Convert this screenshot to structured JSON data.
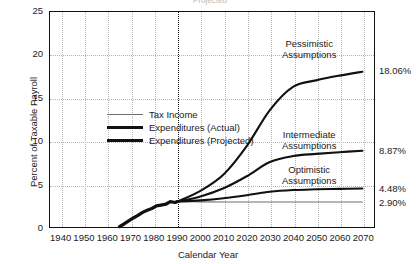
{
  "clipped_title": "Projected",
  "chart_data": {
    "type": "line",
    "title": "",
    "xlabel": "Calendar Year",
    "ylabel": "Percent of Taxable Payroll",
    "xlim": [
      1935,
      2075
    ],
    "ylim": [
      0,
      25
    ],
    "xticks": [
      1940,
      1950,
      1960,
      1970,
      1980,
      1990,
      2000,
      2010,
      2020,
      2030,
      2040,
      2050,
      2060,
      2070
    ],
    "yticks": [
      0,
      5,
      10,
      15,
      20,
      25
    ],
    "grid": true,
    "legend_position": "inside-upper-left",
    "vertical_marker": {
      "x": 1990,
      "style": "dotted",
      "label": ""
    },
    "series": [
      {
        "name": "Tax Income",
        "style": "thin",
        "color": "#6f6f6f",
        "x": [
          1990,
          2000,
          2010,
          2020,
          2030,
          2040,
          2050,
          2060,
          2070
        ],
        "values": [
          2.95,
          2.92,
          2.9,
          2.9,
          2.9,
          2.9,
          2.9,
          2.9,
          2.9
        ],
        "end_label": "2.90%"
      },
      {
        "name": "Expenditures (Actual)",
        "style": "thick",
        "color": "#111111",
        "x": [
          1965,
          1967,
          1969,
          1971,
          1973,
          1975,
          1977,
          1979,
          1981,
          1983,
          1985,
          1987,
          1989,
          1990
        ],
        "values": [
          0.05,
          0.35,
          0.7,
          1.05,
          1.35,
          1.7,
          1.95,
          2.15,
          2.45,
          2.55,
          2.65,
          2.95,
          2.85,
          2.95
        ]
      },
      {
        "name": "Expenditures (Projected)",
        "style": "medium",
        "color": "#111111",
        "scenario": "Pessimistic Assumptions",
        "x": [
          1990,
          2000,
          2010,
          2020,
          2030,
          2040,
          2050,
          2060,
          2070
        ],
        "values": [
          2.95,
          4.2,
          6.1,
          9.4,
          13.6,
          16.3,
          17.05,
          17.6,
          18.06
        ],
        "end_label": "18.06%"
      },
      {
        "name": "Expenditures (Projected)",
        "style": "medium",
        "color": "#111111",
        "scenario": "Intermediate Assumptions",
        "x": [
          1990,
          2000,
          2010,
          2020,
          2030,
          2040,
          2050,
          2060,
          2070
        ],
        "values": [
          2.95,
          3.55,
          4.5,
          5.9,
          7.55,
          8.25,
          8.5,
          8.7,
          8.87
        ],
        "end_label": "8.87%"
      },
      {
        "name": "Expenditures (Projected)",
        "style": "medium",
        "color": "#111111",
        "scenario": "Optimistic Assumptions",
        "x": [
          1990,
          2000,
          2010,
          2020,
          2030,
          2040,
          2050,
          2060,
          2070
        ],
        "values": [
          2.95,
          3.1,
          3.35,
          3.7,
          4.1,
          4.3,
          4.38,
          4.43,
          4.48
        ],
        "end_label": "4.48%"
      }
    ],
    "annotations": [
      {
        "id": "pessimistic",
        "line1": "Pessimistic",
        "line2": "Assumptions"
      },
      {
        "id": "intermediate",
        "line1": "Intermediate",
        "line2": "Assumptions"
      },
      {
        "id": "optimistic",
        "line1": "Optimistic",
        "line2": "Assumptions"
      }
    ],
    "end_labels": [
      "18.06%",
      "8.87%",
      "4.48%",
      "2.90%"
    ],
    "legend": [
      {
        "label": "Tax Income",
        "style": "thin"
      },
      {
        "label": "Expenditures (Actual)",
        "style": "thick"
      },
      {
        "label": "Expenditures (Projected)",
        "style": "medium"
      }
    ]
  }
}
